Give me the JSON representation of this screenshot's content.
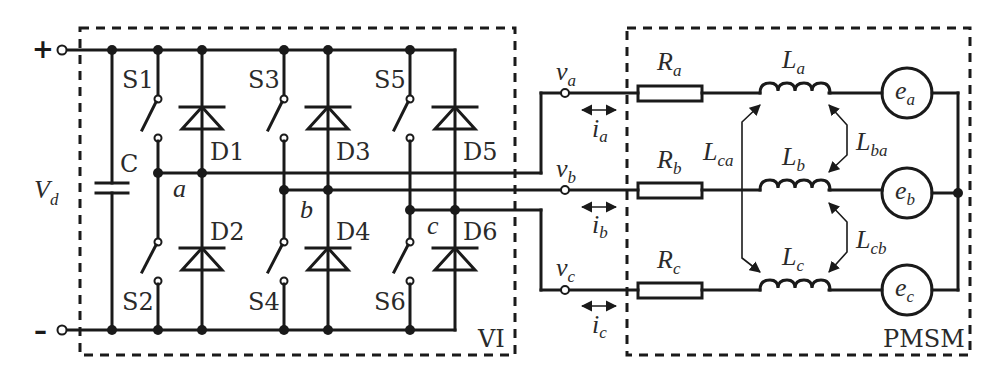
{
  "diagram": {
    "type": "circuit-schematic",
    "dc_link": {
      "plus_sign": "+",
      "minus_sign": "–",
      "voltage_label": "V",
      "voltage_sub": "d",
      "capacitor_label": "C"
    },
    "inverter": {
      "box_label": "VI",
      "switches": [
        "S1",
        "S2",
        "S3",
        "S4",
        "S5",
        "S6"
      ],
      "diodes": [
        "D1",
        "D2",
        "D3",
        "D4",
        "D5",
        "D6"
      ],
      "phase_nodes": [
        "a",
        "b",
        "c"
      ]
    },
    "outputs": {
      "voltages": [
        {
          "main": "v",
          "sub": "a"
        },
        {
          "main": "v",
          "sub": "b"
        },
        {
          "main": "v",
          "sub": "c"
        }
      ],
      "currents": [
        {
          "main": "i",
          "sub": "a"
        },
        {
          "main": "i",
          "sub": "b"
        },
        {
          "main": "i",
          "sub": "c"
        }
      ]
    },
    "motor": {
      "box_label": "PMSM",
      "resistors": [
        {
          "main": "R",
          "sub": "a"
        },
        {
          "main": "R",
          "sub": "b"
        },
        {
          "main": "R",
          "sub": "c"
        }
      ],
      "inductors": [
        {
          "main": "L",
          "sub": "a"
        },
        {
          "main": "L",
          "sub": "b"
        },
        {
          "main": "L",
          "sub": "c"
        }
      ],
      "mutual_inductances": [
        {
          "main": "L",
          "sub": "ca"
        },
        {
          "main": "L",
          "sub": "ba"
        },
        {
          "main": "L",
          "sub": "cb"
        }
      ],
      "emfs": [
        {
          "main": "e",
          "sub": "a"
        },
        {
          "main": "e",
          "sub": "b"
        },
        {
          "main": "e",
          "sub": "c"
        }
      ]
    }
  }
}
